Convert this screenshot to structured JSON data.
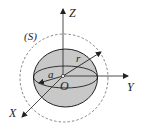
{
  "diagram": {
    "labels": {
      "z_axis": "Z",
      "y_axis": "Y",
      "x_axis": "X",
      "origin": "O",
      "radius_r": "r",
      "radius_a": "a",
      "surface": "(S)"
    },
    "colors": {
      "sphere_fill": "#c8c8c8",
      "stroke": "#222222",
      "dashed_circle": "#555555"
    }
  }
}
